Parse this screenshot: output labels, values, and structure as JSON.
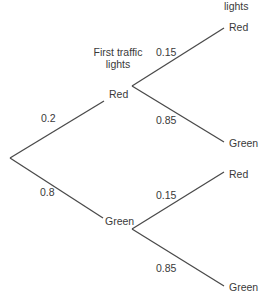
{
  "headers": {
    "first": "First traffic\nlights",
    "first_line1": "First traffic",
    "first_line2": "lights",
    "second_partial": "lights"
  },
  "tree": {
    "root_branches": [
      {
        "prob": "0.2",
        "outcome": "Red"
      },
      {
        "prob": "0.8",
        "outcome": "Green"
      }
    ],
    "red_branches": [
      {
        "prob": "0.15",
        "outcome": "Red"
      },
      {
        "prob": "0.85",
        "outcome": "Green"
      }
    ],
    "green_branches": [
      {
        "prob": "0.15",
        "outcome": "Red"
      },
      {
        "prob": "0.85",
        "outcome": "Green"
      }
    ]
  },
  "colors": {
    "line": "#4a4a4a",
    "text": "#3a3a3a"
  }
}
